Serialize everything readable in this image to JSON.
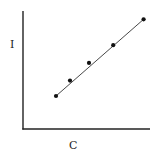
{
  "chart_data": {
    "type": "scatter",
    "title": "",
    "xlabel": "C",
    "ylabel": "I",
    "grid": false,
    "legend": null,
    "ticks": false,
    "xlim": [
      0,
      10
    ],
    "ylim": [
      0,
      10
    ],
    "x": [
      2.6,
      3.7,
      5.2,
      7.1,
      9.5
    ],
    "y": [
      2.8,
      4.1,
      5.6,
      7.1,
      9.3
    ],
    "trendline": {
      "type": "linear",
      "from": [
        2.6,
        2.8
      ],
      "to": [
        9.5,
        9.3
      ]
    },
    "colors": {
      "axis": "#222222",
      "points": "#111111",
      "line": "#333333"
    }
  },
  "labels": {
    "x_axis": "C",
    "y_axis": "I"
  }
}
